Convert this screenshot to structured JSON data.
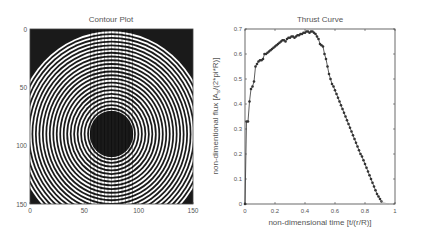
{
  "chart_data": [
    {
      "type": "heatmap",
      "title": "Contour Plot",
      "xlabel": "",
      "ylabel": "",
      "xlim": [
        0,
        150
      ],
      "ylim": [
        150,
        0
      ],
      "xticks": [
        "0",
        "50",
        "100",
        "150"
      ],
      "yticks": [
        "0",
        "50",
        "100",
        "150"
      ],
      "description": "Concentric circular contour rings (alternating black/white) centered near (75, 90) with a solid dark core disc of radius ~20 and outer ring radius ~85; dark corners outside the outermost ring",
      "center": [
        75,
        90
      ],
      "core_radius": 20,
      "outer_radius": 88,
      "colors": {
        "dark": "#1a1a1a",
        "light": "#ffffff"
      }
    },
    {
      "type": "line",
      "title": "Thrust Curve",
      "xlabel": "non-dimensional time [t/(r/R)]",
      "ylabel": "non-dimentional flux [A_s/(2*pi*R)]",
      "ylabel_main": "non-dimentional flux [A",
      "ylabel_sub": "s",
      "ylabel_tail": "/(2*pi*R)]",
      "xlim": [
        0,
        1
      ],
      "ylim": [
        0,
        0.7
      ],
      "xticks": [
        "0",
        "0.2",
        "0.4",
        "0.6",
        "0.8",
        "1"
      ],
      "yticks": [
        "0",
        "0.1",
        "0.2",
        "0.3",
        "0.4",
        "0.5",
        "0.6",
        "0.7"
      ],
      "grid": false,
      "series": [
        {
          "name": "thrust",
          "marker": "+",
          "color": "#333333",
          "x": [
            0.0,
            0.01,
            0.02,
            0.03,
            0.04,
            0.05,
            0.06,
            0.07,
            0.08,
            0.09,
            0.1,
            0.11,
            0.12,
            0.13,
            0.14,
            0.15,
            0.16,
            0.17,
            0.18,
            0.19,
            0.2,
            0.21,
            0.22,
            0.23,
            0.24,
            0.25,
            0.26,
            0.27,
            0.28,
            0.29,
            0.3,
            0.31,
            0.32,
            0.33,
            0.34,
            0.35,
            0.36,
            0.37,
            0.38,
            0.39,
            0.4,
            0.41,
            0.42,
            0.43,
            0.44,
            0.45,
            0.46,
            0.47,
            0.48,
            0.49,
            0.5,
            0.51,
            0.52,
            0.53,
            0.54,
            0.55,
            0.56,
            0.57,
            0.58,
            0.59,
            0.6,
            0.61,
            0.62,
            0.63,
            0.64,
            0.65,
            0.66,
            0.67,
            0.68,
            0.69,
            0.7,
            0.71,
            0.72,
            0.73,
            0.74,
            0.75,
            0.76,
            0.77,
            0.78,
            0.79,
            0.8,
            0.81,
            0.82,
            0.83,
            0.84,
            0.85,
            0.86,
            0.87,
            0.88,
            0.89,
            0.9,
            0.91
          ],
          "y": [
            0.0,
            0.33,
            0.33,
            0.41,
            0.46,
            0.47,
            0.49,
            0.55,
            0.56,
            0.57,
            0.575,
            0.575,
            0.58,
            0.6,
            0.6,
            0.605,
            0.61,
            0.615,
            0.62,
            0.625,
            0.63,
            0.635,
            0.64,
            0.645,
            0.65,
            0.655,
            0.655,
            0.65,
            0.66,
            0.665,
            0.665,
            0.67,
            0.67,
            0.665,
            0.67,
            0.675,
            0.675,
            0.68,
            0.68,
            0.685,
            0.685,
            0.69,
            0.69,
            0.685,
            0.69,
            0.69,
            0.685,
            0.68,
            0.67,
            0.66,
            0.64,
            0.635,
            0.63,
            0.6,
            0.58,
            0.55,
            0.52,
            0.5,
            0.48,
            0.47,
            0.455,
            0.44,
            0.425,
            0.41,
            0.395,
            0.38,
            0.365,
            0.35,
            0.335,
            0.32,
            0.305,
            0.29,
            0.275,
            0.26,
            0.245,
            0.23,
            0.215,
            0.2,
            0.19,
            0.175,
            0.16,
            0.145,
            0.13,
            0.115,
            0.1,
            0.085,
            0.07,
            0.055,
            0.04,
            0.03,
            0.02,
            0.01
          ]
        },
        {
          "name": "tail",
          "marker": "none",
          "color": "#aaaaaa",
          "x": [
            0.91,
            0.93,
            0.95,
            0.96
          ],
          "y": [
            0.01,
            0.005,
            0.0,
            0.0
          ]
        }
      ]
    }
  ]
}
